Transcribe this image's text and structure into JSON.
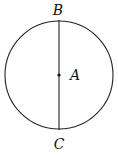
{
  "diagram": {
    "type": "circle-with-diameter",
    "points": [
      {
        "name": "B",
        "role": "top endpoint of diameter"
      },
      {
        "name": "A",
        "role": "center"
      },
      {
        "name": "C",
        "role": "bottom endpoint of diameter"
      }
    ],
    "labels": {
      "top": "B",
      "center": "A",
      "bottom": "C"
    },
    "colors": {
      "stroke": "#222222",
      "background": "#ffffff"
    }
  }
}
